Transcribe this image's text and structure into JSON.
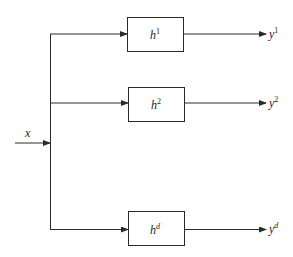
{
  "diagram": {
    "type": "block-diagram",
    "input": {
      "label": "x"
    },
    "blocks": [
      {
        "base": "h",
        "sup": "1",
        "output_base": "y",
        "output_sup": "1"
      },
      {
        "base": "h",
        "sup": "2",
        "output_base": "y",
        "output_sup": "2"
      },
      {
        "base": "h",
        "sup": "d",
        "output_base": "y",
        "output_sup": "d"
      }
    ],
    "colors": {
      "stroke": "#2a2a2a",
      "text": "#222222",
      "background": "#ffffff"
    }
  }
}
